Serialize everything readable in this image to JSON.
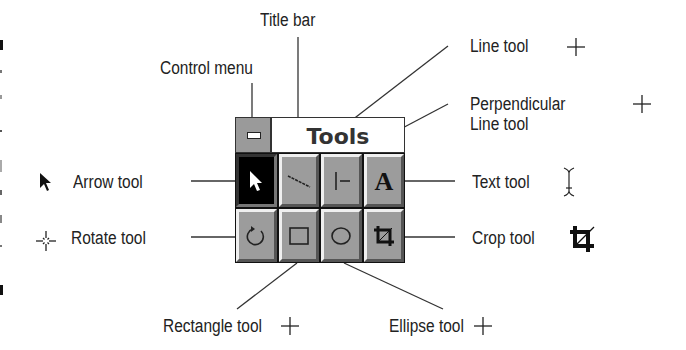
{
  "palette": {
    "title": "Tools",
    "control_menu_icon": "minus-box-icon",
    "tools": [
      {
        "name": "arrow",
        "icon": "arrow-pointer-icon",
        "selected": true
      },
      {
        "name": "line",
        "icon": "diagonal-line-icon",
        "selected": false
      },
      {
        "name": "perpendicular-line",
        "icon": "perpendicular-line-icon",
        "selected": false
      },
      {
        "name": "text",
        "icon": "letter-a-icon",
        "selected": false
      },
      {
        "name": "rotate",
        "icon": "rotate-icon",
        "selected": false
      },
      {
        "name": "rectangle",
        "icon": "rectangle-icon",
        "selected": false
      },
      {
        "name": "ellipse",
        "icon": "ellipse-icon",
        "selected": false
      },
      {
        "name": "crop",
        "icon": "crop-icon",
        "selected": false
      }
    ]
  },
  "callouts": {
    "title_bar": "Title bar",
    "control_menu": "Control menu",
    "line_tool": "Line tool",
    "perpendicular_line_tool": "Perpendicular\nLine tool",
    "arrow_tool": "Arrow tool",
    "rotate_tool": "Rotate tool",
    "text_tool": "Text tool",
    "crop_tool": "Crop tool",
    "rectangle_tool": "Rectangle tool",
    "ellipse_tool": "Ellipse tool"
  },
  "cursor_icons": {
    "arrow_tool": "arrow-cursor-icon",
    "rotate_tool": "rotate-crosshair-cursor-icon",
    "line_tool": "crosshair-cursor-icon",
    "perpendicular_line_tool": "crosshair-cursor-icon",
    "text_tool": "i-beam-cursor-icon",
    "crop_tool": "crop-cursor-icon",
    "rectangle_tool": "crosshair-cursor-icon",
    "ellipse_tool": "crosshair-cursor-icon"
  },
  "colors": {
    "button_face": "#9c9c9c",
    "selected_button": "#000000",
    "frame": "#111111",
    "text": "#222222"
  }
}
